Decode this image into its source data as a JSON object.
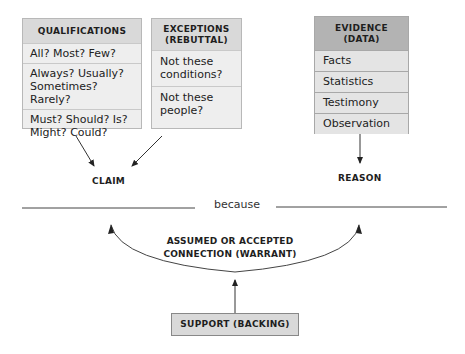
{
  "diagram": {
    "type": "Toulmin argument model",
    "qualifications": {
      "title": "QUALIFICATIONS",
      "items": [
        "All? Most? Few?",
        "Always? Usually? Sometimes? Rarely?",
        "Must? Should? Is? Might? Could?"
      ]
    },
    "exceptions": {
      "title": "EXCEPTIONS (REBUTTAL)",
      "items": [
        "Not these conditions?",
        "Not these people?"
      ]
    },
    "evidence": {
      "title": "EVIDENCE (DATA)",
      "items": [
        "Facts",
        "Statistics",
        "Testimony",
        "Observation"
      ]
    },
    "claim": "CLAIM",
    "reason": "REASON",
    "connector": "because",
    "warrant": "ASSUMED OR ACCEPTED CONNECTION (WARRANT)",
    "support": "SUPPORT (BACKING)",
    "colors": {
      "box_fill": "#eeeeee",
      "header_fill": "#d9d9d9",
      "evidence_header_fill": "#b3b3b3",
      "line": "#333333"
    }
  }
}
